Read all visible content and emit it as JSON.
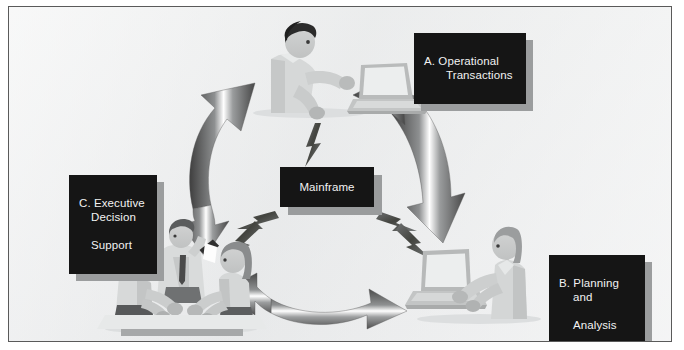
{
  "diagram": {
    "background_color": "#eceded",
    "border_color": "#5a5a5a",
    "box_color": "#151515",
    "box_text_color": "#f2f2f2",
    "box_shadow_color": "#9b9d9e",
    "arrow_color_dark": "#4c4c4c",
    "arrow_color_light": "#ffffff",
    "figure_color": "#c9cbcb",
    "figure_shadow": "#a9abac"
  },
  "labels": {
    "a": {
      "line1": "A. Operational",
      "line2": "Transactions"
    },
    "b": {
      "line1": "B. Planning",
      "line2": "and",
      "line3": "Analysis"
    },
    "c": {
      "line1": "C. Executive",
      "line2": "Decision",
      "line3": "Support"
    },
    "center": "Mainframe"
  },
  "nodes": [
    {
      "id": "a",
      "name": "operational-transactions",
      "art": "person-at-laptop",
      "position": "top-center"
    },
    {
      "id": "b",
      "name": "planning-and-analysis",
      "art": "person-at-desktop",
      "position": "bottom-right"
    },
    {
      "id": "c",
      "name": "executive-decision-support",
      "art": "meeting-group-of-three",
      "position": "bottom-left"
    },
    {
      "id": "center",
      "name": "mainframe",
      "art": "label-box",
      "position": "center"
    }
  ],
  "connectors": [
    {
      "name": "arrow-c-to-a",
      "type": "curved-double-arrow",
      "from": "c",
      "to": "a"
    },
    {
      "name": "arrow-a-to-b",
      "type": "curved-double-arrow",
      "from": "a",
      "to": "b"
    },
    {
      "name": "arrow-c-to-b",
      "type": "curved-double-arrow",
      "from": "c",
      "to": "b"
    },
    {
      "name": "bolt-mainframe-to-a",
      "type": "lightning-bolt",
      "from": "center",
      "to": "a"
    },
    {
      "name": "bolt-mainframe-to-c",
      "type": "lightning-bolt",
      "from": "center",
      "to": "c"
    },
    {
      "name": "bolt-mainframe-to-b",
      "type": "lightning-bolt",
      "from": "center",
      "to": "b"
    }
  ]
}
